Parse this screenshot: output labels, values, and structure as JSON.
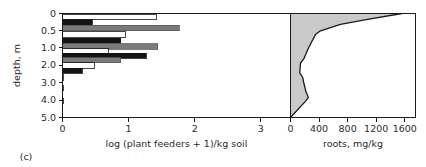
{
  "figure": {
    "caption": "(c)",
    "background": "#ffffff",
    "frame_color": "#1a1a1a"
  },
  "shared_axis": {
    "label": "depth, m",
    "tick_labels": [
      "0",
      "0.5",
      "1.0",
      "2.0",
      "3.0",
      "4.0",
      "5.0"
    ],
    "tick_values": [
      0,
      0.5,
      1.0,
      2.0,
      3.0,
      4.0,
      5.0
    ],
    "range": [
      0,
      5
    ],
    "orientation": "vertical-inverted"
  },
  "chart_data": [
    {
      "type": "bar",
      "id": "plant-feeders-panel",
      "orientation": "horizontal",
      "title": "",
      "xlabel": "log (plant feeders + 1)/kg soil",
      "ylabel": "depth, m",
      "xlim": [
        0,
        3.45
      ],
      "ylim": [
        0,
        5
      ],
      "xticks": [
        0,
        1,
        2,
        3
      ],
      "xtick_labels": [
        "0",
        "1",
        "2",
        "3"
      ],
      "yticks": [
        0,
        0.5,
        1.0,
        2.0,
        3.0,
        4.0,
        5.0
      ],
      "ytick_labels": [
        "0",
        "0.5",
        "1.0",
        "2.0",
        "3.0",
        "4.0",
        "5.0"
      ],
      "grid": false,
      "legend": "none",
      "series": [
        {
          "name": "series-white",
          "fill": "#ffffff",
          "stroke": "#1a1a1a"
        },
        {
          "name": "series-black",
          "fill": "#141414",
          "stroke": "#141414"
        },
        {
          "name": "series-gray",
          "fill": "#7a7a7a",
          "stroke": "#5a5a5a"
        }
      ],
      "bars": [
        {
          "depth": 0.1,
          "series": "series-white",
          "value": 1.42
        },
        {
          "depth": 0.27,
          "series": "series-black",
          "value": 0.45
        },
        {
          "depth": 0.43,
          "series": "series-gray",
          "value": 1.77
        },
        {
          "depth": 0.62,
          "series": "series-white",
          "value": 0.95
        },
        {
          "depth": 0.8,
          "series": "series-black",
          "value": 0.88
        },
        {
          "depth": 0.97,
          "series": "series-gray",
          "value": 1.44
        },
        {
          "depth": 1.22,
          "series": "series-white",
          "value": 0.7
        },
        {
          "depth": 1.47,
          "series": "series-black",
          "value": 1.27
        },
        {
          "depth": 1.73,
          "series": "series-gray",
          "value": 0.88
        },
        {
          "depth": 2.02,
          "series": "series-white",
          "value": 0.48
        },
        {
          "depth": 2.33,
          "series": "series-black",
          "value": 0.3
        },
        {
          "depth": 2.72,
          "series": "series-white",
          "value": 0.02
        },
        {
          "depth": 3.3,
          "series": "series-white",
          "value": 0.02
        },
        {
          "depth": 4.05,
          "series": "series-white",
          "value": 0.02
        }
      ]
    },
    {
      "type": "area",
      "id": "roots-panel",
      "orientation": "horizontal",
      "title": "",
      "xlabel": "roots, mg/kg",
      "ylabel": "depth, m",
      "xlim": [
        0,
        1750
      ],
      "ylim": [
        0,
        5
      ],
      "xticks": [
        0,
        400,
        800,
        1200,
        1600
      ],
      "xtick_labels": [
        "0",
        "400",
        "800",
        "1200",
        "1600"
      ],
      "yticks": [
        0,
        0.5,
        1.0,
        2.0,
        3.0,
        4.0,
        5.0
      ],
      "ytick_labels": [
        "0",
        "0.5",
        "1.0",
        "2.0",
        "3.0",
        "4.0",
        "5.0"
      ],
      "grid": false,
      "legend": "none",
      "fill": "#c9c9c9",
      "stroke": "#1a1a1a",
      "points": [
        {
          "depth": 0.0,
          "roots": 1560
        },
        {
          "depth": 0.17,
          "roots": 1080
        },
        {
          "depth": 0.32,
          "roots": 700
        },
        {
          "depth": 0.52,
          "roots": 410
        },
        {
          "depth": 0.62,
          "roots": 350
        },
        {
          "depth": 1.0,
          "roots": 255
        },
        {
          "depth": 1.62,
          "roots": 190
        },
        {
          "depth": 1.9,
          "roots": 140
        },
        {
          "depth": 2.45,
          "roots": 130
        },
        {
          "depth": 2.7,
          "roots": 170
        },
        {
          "depth": 3.0,
          "roots": 185
        },
        {
          "depth": 3.5,
          "roots": 215
        },
        {
          "depth": 3.85,
          "roots": 250
        },
        {
          "depth": 4.05,
          "roots": 215
        },
        {
          "depth": 5.0,
          "roots": 0
        }
      ]
    }
  ]
}
